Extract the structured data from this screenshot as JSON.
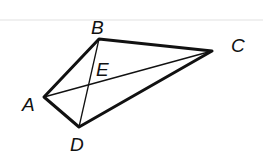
{
  "diagram": {
    "title": "",
    "type": "quadrilateral-with-diagonals",
    "vertices": {
      "A": {
        "label": "A",
        "x": 44,
        "y": 97,
        "lx": 22,
        "ly": 111
      },
      "B": {
        "label": "B",
        "x": 99,
        "y": 39,
        "lx": 91,
        "ly": 34
      },
      "C": {
        "label": "C",
        "x": 212,
        "y": 51,
        "lx": 231,
        "ly": 52
      },
      "D": {
        "label": "D",
        "x": 79,
        "y": 127,
        "lx": 70,
        "ly": 151
      },
      "E": {
        "label": "E",
        "x": 89,
        "y": 84,
        "lx": 96,
        "ly": 76
      }
    },
    "edges": [
      [
        "A",
        "B"
      ],
      [
        "B",
        "C"
      ],
      [
        "C",
        "D"
      ],
      [
        "D",
        "A"
      ]
    ],
    "diagonals": [
      [
        "A",
        "C"
      ],
      [
        "B",
        "D"
      ]
    ],
    "stroke_color": "#111111"
  }
}
